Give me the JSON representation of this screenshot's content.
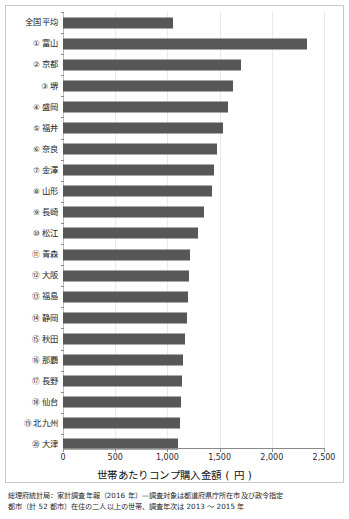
{
  "chart_data": {
    "type": "bar",
    "orientation": "horizontal",
    "title": "",
    "xlabel": "世帯あたりコンプ購入金額 ( 円 )",
    "ylabel": "",
    "xlim": [
      0,
      2500
    ],
    "xticks": [
      "0",
      "500",
      "1,000",
      "1,500",
      "2,000",
      "2,500"
    ],
    "xtick_values": [
      0,
      500,
      1000,
      1500,
      2000,
      2500
    ],
    "grid": true,
    "legend": "none",
    "bar_color": "#575757",
    "categories": [
      "全国平均",
      "富山",
      "京都",
      "堺",
      "盛岡",
      "福井",
      "奈良",
      "金澤",
      "山形",
      "長崎",
      "松江",
      "青森",
      "大阪",
      "福島",
      "静岡",
      "秋田",
      "那覇",
      "長野",
      "仙台",
      "北九州",
      "大津"
    ],
    "ranks": [
      "",
      "①",
      "②",
      "③",
      "④",
      "⑤",
      "⑥",
      "⑦",
      "⑧",
      "⑨",
      "⑩",
      "⑪",
      "⑫",
      "⑬",
      "⑭",
      "⑮",
      "⑯",
      "⑰",
      "⑱",
      "⑲",
      "⑳"
    ],
    "values": [
      1050,
      2340,
      1705,
      1630,
      1580,
      1530,
      1475,
      1450,
      1430,
      1350,
      1290,
      1215,
      1210,
      1200,
      1190,
      1165,
      1150,
      1140,
      1130,
      1120,
      1100
    ]
  },
  "footnote": {
    "line1": "総理府統計局：家計調査年報（2016 年）—調査対象は都道府県庁所在市及び政令指定",
    "line2": "都市（計 52 都市）在住の二人以上の世帯、調査年次は 2013 〜 2015 年"
  }
}
